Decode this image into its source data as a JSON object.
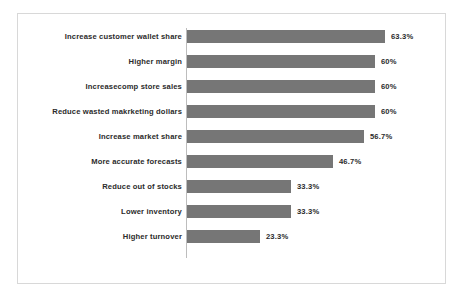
{
  "chart_data": {
    "type": "bar",
    "orientation": "horizontal",
    "title": "",
    "subtitle": "",
    "xlabel": "",
    "ylabel": "",
    "grid": false,
    "legend": false,
    "axis_line": true,
    "xlim": [
      0,
      63.3
    ],
    "categories": [
      "Increase customer wallet share",
      "Higher margin",
      "Increasecomp store sales",
      "Reduce wasted makrketing dollars",
      "Increase market share",
      "More accurate forecasts",
      "Reduce out of stocks",
      "Lower inventory",
      "Higher turnover"
    ],
    "values": [
      63.3,
      60,
      60,
      60,
      56.7,
      46.7,
      33.3,
      33.3,
      23.3
    ],
    "value_labels": [
      "63.3%",
      "60%",
      "60%",
      "60%",
      "56.7%",
      "46.7%",
      "33.3%",
      "33.3%",
      "23.3%"
    ],
    "bar_color": "#767676",
    "text_color": "#2b2b2b",
    "axis_color": "#bdbdbd",
    "frame_color": "#d8d8d8",
    "background": "#ffffff"
  }
}
